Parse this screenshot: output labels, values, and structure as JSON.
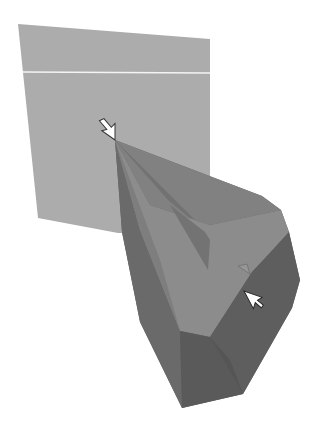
{
  "figure": {
    "colors": {
      "background": "#ffffff",
      "panel": "#aaaaaa",
      "panel_line": "#f2f2f2",
      "solid_dark": "#686868",
      "solid_mid": "#7a7a7a",
      "solid_light_face": "#8e8e8e",
      "solid_darkest": "#5a5a5a",
      "cursor_fill": "#ffffff",
      "cursor_stroke": "#333333"
    },
    "elements": {
      "panel": {
        "label": "light panel"
      },
      "solid": {
        "label": "dark polyhedron"
      },
      "cursor_primary": {
        "label": "cursor at apex"
      },
      "cursor_secondary": {
        "label": "cursor dragging handle"
      },
      "handle": {
        "label": "triangle handle"
      }
    }
  }
}
